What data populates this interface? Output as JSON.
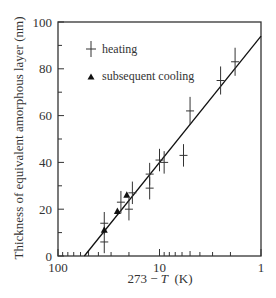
{
  "chart_data": {
    "type": "scatter",
    "title": "",
    "xlabel": "273 − T (K)",
    "xlabel_parts": {
      "pre": "273 − ",
      "var": "T",
      "post": "  (K)"
    },
    "ylabel": "Thickness of equivalent amorphous layer  (nm)",
    "x_scale": "log",
    "x_reversed": true,
    "xlim": [
      100,
      1
    ],
    "ylim": [
      0,
      100
    ],
    "x_ticks": [
      100,
      10,
      1
    ],
    "x_tick_labels": [
      "100",
      "10",
      "1"
    ],
    "y_ticks": [
      0,
      20,
      40,
      60,
      80,
      100
    ],
    "y_tick_labels": [
      "0",
      "20",
      "40",
      "60",
      "80",
      "100"
    ],
    "grid": false,
    "legend": {
      "position": "upper-left",
      "entries": [
        {
          "label": "heating",
          "marker": "vertical error bar with horizontal tick"
        },
        {
          "label": "subsequent cooling",
          "marker": "filled triangle"
        }
      ]
    },
    "series": [
      {
        "name": "heating",
        "marker": "errorbar-cross",
        "points": [
          {
            "x": 35,
            "y": 14,
            "err": 4
          },
          {
            "x": 35,
            "y": 6,
            "err": 4
          },
          {
            "x": 24,
            "y": 23,
            "err": 4
          },
          {
            "x": 20,
            "y": 20,
            "err": 4
          },
          {
            "x": 18.5,
            "y": 27,
            "err": 4
          },
          {
            "x": 12.5,
            "y": 35,
            "err": 4
          },
          {
            "x": 12.5,
            "y": 29,
            "err": 4
          },
          {
            "x": 10,
            "y": 41,
            "err": 4
          },
          {
            "x": 9,
            "y": 40,
            "err": 4
          },
          {
            "x": 5.8,
            "y": 43,
            "err": 4
          },
          {
            "x": 5,
            "y": 62,
            "err": 5
          },
          {
            "x": 2.5,
            "y": 75,
            "err": 5
          },
          {
            "x": 1.8,
            "y": 83,
            "err": 5
          }
        ]
      },
      {
        "name": "subsequent cooling",
        "marker": "triangle",
        "points": [
          {
            "x": 35,
            "y": 11
          },
          {
            "x": 26,
            "y": 19
          },
          {
            "x": 21,
            "y": 26
          }
        ]
      },
      {
        "name": "fit line",
        "marker": "line",
        "points": [
          {
            "x": 55,
            "y": 0
          },
          {
            "x": 1,
            "y": 94
          }
        ]
      }
    ]
  }
}
